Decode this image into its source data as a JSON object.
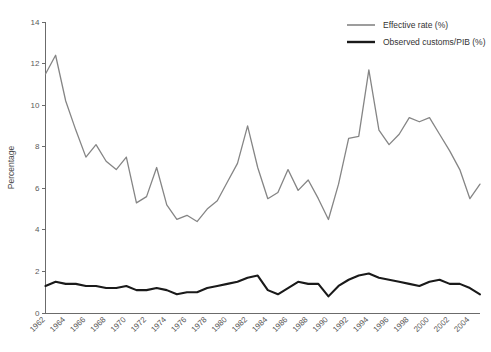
{
  "chart_data": {
    "type": "line",
    "title": "",
    "xlabel": "",
    "ylabel": "Percentage",
    "ylim": [
      0,
      14
    ],
    "yticks": [
      0,
      2,
      4,
      6,
      8,
      10,
      12,
      14
    ],
    "xlim": [
      1962,
      2005
    ],
    "xticks": [
      1962,
      1964,
      1966,
      1968,
      1970,
      1972,
      1974,
      1976,
      1978,
      1980,
      1982,
      1984,
      1986,
      1988,
      1990,
      1992,
      1994,
      1996,
      1998,
      2000,
      2002,
      2004
    ],
    "grid": false,
    "legend_position": "top-right",
    "x": [
      1962,
      1963,
      1964,
      1965,
      1966,
      1967,
      1968,
      1969,
      1970,
      1971,
      1972,
      1973,
      1974,
      1975,
      1976,
      1977,
      1978,
      1979,
      1980,
      1981,
      1982,
      1983,
      1984,
      1985,
      1986,
      1987,
      1988,
      1989,
      1990,
      1991,
      1992,
      1993,
      1994,
      1995,
      1996,
      1997,
      1998,
      1999,
      2000,
      2001,
      2002,
      2003,
      2004,
      2005
    ],
    "series": [
      {
        "name": "Effective rate (%)",
        "color": "#858585",
        "values": [
          11.5,
          12.4,
          10.2,
          8.8,
          7.5,
          8.1,
          7.3,
          6.9,
          7.5,
          5.3,
          5.6,
          7.0,
          5.2,
          4.5,
          4.7,
          4.4,
          5.0,
          5.4,
          6.3,
          7.2,
          9.0,
          7.0,
          5.5,
          5.8,
          6.9,
          5.9,
          6.4,
          5.5,
          4.5,
          6.2,
          8.4,
          8.5,
          11.7,
          8.8,
          8.1,
          8.6,
          9.4,
          9.2,
          9.4,
          8.6,
          7.8,
          6.9,
          5.5,
          6.2
        ]
      },
      {
        "name": "Observed customs/PIB (%)",
        "color": "#1a1a1a",
        "values": [
          1.3,
          1.5,
          1.4,
          1.4,
          1.3,
          1.3,
          1.2,
          1.2,
          1.3,
          1.1,
          1.1,
          1.2,
          1.1,
          0.9,
          1.0,
          1.0,
          1.2,
          1.3,
          1.4,
          1.5,
          1.7,
          1.8,
          1.1,
          0.9,
          1.2,
          1.5,
          1.4,
          1.4,
          0.8,
          1.3,
          1.6,
          1.8,
          1.9,
          1.7,
          1.6,
          1.5,
          1.4,
          1.3,
          1.5,
          1.6,
          1.4,
          1.4,
          1.2,
          0.9
        ]
      }
    ]
  },
  "legend": {
    "items": [
      {
        "label": "Effective rate (%)",
        "color": "#858585"
      },
      {
        "label": "Observed customs/PIB (%)",
        "color": "#1a1a1a"
      }
    ]
  },
  "axes": {
    "y_title": "Percentage"
  }
}
